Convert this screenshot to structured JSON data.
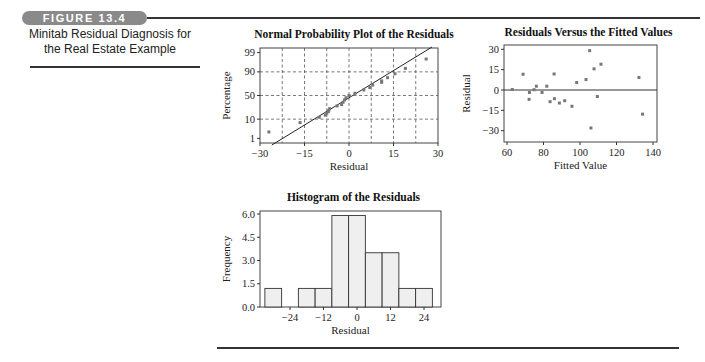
{
  "figure": {
    "badge": "FIGURE 13.4",
    "caption_line1": "Minitab Residual Diagnosis for",
    "caption_line2": "the Real Estate Example"
  },
  "chart_data": [
    {
      "id": "normal-probability-plot",
      "type": "scatter",
      "title": "Normal Probability Plot of the Residuals",
      "xlabel": "Residual",
      "ylabel": "Percentage",
      "xlim": [
        -30,
        30
      ],
      "xticks": [
        -30,
        -15,
        0,
        15,
        30
      ],
      "xtick_labels": [
        "−30",
        "−15",
        "0",
        "15",
        "30"
      ],
      "yticks_pct": [
        1,
        10,
        50,
        90,
        99
      ],
      "ytick_labels": [
        "1",
        "10",
        "50",
        "90",
        "99"
      ],
      "grid": true,
      "fit_line": {
        "from": [
          -26,
          0.5
        ],
        "to": [
          27,
          99.5
        ]
      },
      "points": [
        [
          -27,
          2.4
        ],
        [
          -16.5,
          7.1
        ],
        [
          -10,
          11.9
        ],
        [
          -8,
          14.3
        ],
        [
          -7.5,
          16.7
        ],
        [
          -7,
          19.0
        ],
        [
          -6.8,
          21.4
        ],
        [
          -6.5,
          23.8
        ],
        [
          -4,
          28.6
        ],
        [
          -2.5,
          31.0
        ],
        [
          -2,
          35.7
        ],
        [
          -1.5,
          40.5
        ],
        [
          -1,
          45.2
        ],
        [
          0,
          50
        ],
        [
          2,
          54.8
        ],
        [
          5,
          61.9
        ],
        [
          7,
          66.7
        ],
        [
          8,
          71.4
        ],
        [
          11,
          76.2
        ],
        [
          11,
          78.6
        ],
        [
          13,
          83.3
        ],
        [
          15.5,
          88.1
        ],
        [
          19,
          92.9
        ],
        [
          26,
          97.6
        ]
      ]
    },
    {
      "id": "residuals-vs-fitted",
      "type": "scatter",
      "title": "Residuals Versus the Fitted Values",
      "xlabel": "Fitted Value",
      "ylabel": "Residual",
      "xlim": [
        59,
        142
      ],
      "ylim": [
        -32,
        32
      ],
      "xticks": [
        60,
        80,
        100,
        120,
        140
      ],
      "yticks": [
        30,
        15,
        0,
        -15,
        -30
      ],
      "ytick_labels": [
        "30",
        "15",
        "0",
        "−15",
        "−30"
      ],
      "reference_line_y": 0,
      "grid": false,
      "points": [
        [
          62.9,
          0.4
        ],
        [
          68.8,
          11.6
        ],
        [
          72.3,
          -1.8
        ],
        [
          72.1,
          -6.9
        ],
        [
          74.8,
          0.2
        ],
        [
          76.1,
          2.8
        ],
        [
          79.2,
          -1.8
        ],
        [
          81.8,
          2.8
        ],
        [
          83.6,
          -8.6
        ],
        [
          85.8,
          11.8
        ],
        [
          86.0,
          -6.4
        ],
        [
          88.7,
          -9.6
        ],
        [
          91.6,
          -7.9
        ],
        [
          95.6,
          -12.0
        ],
        [
          98.2,
          5.5
        ],
        [
          103.3,
          7.7
        ],
        [
          105.3,
          29.0
        ],
        [
          107.7,
          15.6
        ],
        [
          111.5,
          19.0
        ],
        [
          109.5,
          -4.8
        ],
        [
          106.0,
          -28.0
        ],
        [
          132.3,
          9.2
        ],
        [
          134.3,
          -17.8
        ]
      ]
    },
    {
      "id": "histogram-residuals",
      "type": "bar",
      "title": "Histogram of the Residuals",
      "xlabel": "Residual",
      "ylabel": "Frequency",
      "bin_width": 6,
      "categories": [
        -30,
        -24,
        -18,
        -12,
        -6,
        0,
        6,
        12,
        18,
        24
      ],
      "values": [
        1.2,
        0,
        1.2,
        1.2,
        5.9,
        5.9,
        3.5,
        3.5,
        1.2,
        1.2
      ],
      "xticks": [
        -24,
        -12,
        0,
        12,
        24
      ],
      "xtick_labels": [
        "−24",
        "−12",
        "0",
        "12",
        "24"
      ],
      "yticks": [
        0.0,
        1.5,
        3.0,
        4.5,
        6.0
      ],
      "ytick_labels": [
        "0.0",
        "1.5",
        "3.0",
        "4.5",
        "6.0"
      ],
      "ylim": [
        0,
        6.2
      ],
      "bar_fill": "#efefef",
      "bar_edge": "#333333"
    }
  ]
}
